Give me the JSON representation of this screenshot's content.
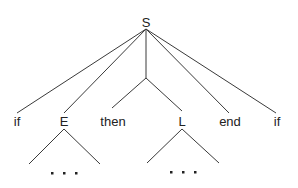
{
  "diagram": {
    "type": "parse-tree",
    "colors": {
      "line": "#3a3a3a",
      "text": "#222222",
      "background": "#ffffff"
    },
    "root": {
      "label": "S"
    },
    "children": [
      {
        "label": "if"
      },
      {
        "label": "E",
        "subtree": "ellipsis",
        "ellipsis": "• • •"
      },
      {
        "label": "then"
      },
      {
        "label": "L",
        "subtree": "ellipsis",
        "ellipsis": "• • •"
      },
      {
        "label": "end"
      },
      {
        "label": "if"
      }
    ]
  }
}
